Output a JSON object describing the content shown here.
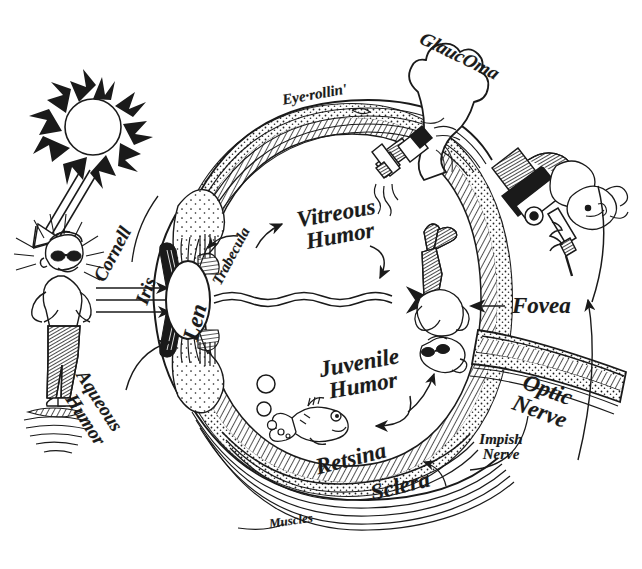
{
  "figure": {
    "medium": "pen-and-ink cartoon illustration",
    "background_color": "#ffffff",
    "ink_color": "#1a1a1a",
    "width": 642,
    "height": 569
  },
  "labels": {
    "eye_rollin": "Eye·rollin'",
    "glaucoma": "GlaucOma",
    "cornell": "Cornell",
    "iris": "Iris",
    "lens": "Len",
    "trabecula": "Trabecula",
    "vitreous_humor": "Vitreous Humor",
    "vitreous_humor_line1": "Vitreous",
    "vitreous_humor_line2": "Humor",
    "juvenile_humor": "Juvenile Humor",
    "juvenile_humor_line1": "Juvenile",
    "juvenile_humor_line2": "Humor",
    "aqueous_humor": "Aqueous Humor",
    "aqueous_humor_line1": "Aqueous",
    "aqueous_humor_line2": "Humor",
    "fovea": "Fovea",
    "optic_nerve": "Optic Nerve",
    "optic_nerve_line1": "Optic",
    "optic_nerve_line2": "Nerve",
    "impish_nerve": "Impish Nerve",
    "impish_nerve_line1": "Impish",
    "impish_nerve_line2": "Nerve",
    "retsina": "Retsina",
    "sclera": "Sclera",
    "muscles": "Muscles"
  },
  "drawn_elements": {
    "sun": "sun-with-flame-rays",
    "light_rays": "three-parallel-rays-with-arrowhead",
    "man_with_sunglasses": "cool-man-in-sunglasses-standing-with-radiating-lines",
    "inverted_man": "same-man-drawn-upside-down-on-retina",
    "fish": "cartoon-fish-with-bubbles",
    "balloon": "glaucoma-shaped-balloon-attached-by-valve",
    "valve_nozzle": "pressure-valve-with-escaping-air",
    "release_nozzle": "second-nozzle-venting-squiggles",
    "mechanic_figure": "upside-down-character-operating-drill-on-optic-nerve",
    "wavy_arrow": "wavy-double-line-arrow-through-vitreous",
    "curved_arrows": "hand-drawn-curved-pointer-arrows"
  }
}
